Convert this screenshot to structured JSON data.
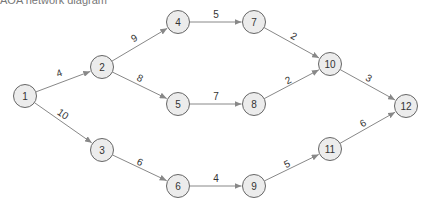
{
  "caption": "AOA network diagram",
  "colors": {
    "node_fill": "#ececec",
    "node_stroke": "#666666",
    "edge": "#888888",
    "text": "#333333"
  },
  "nodes": [
    {
      "id": "1",
      "x": 25,
      "y": 96
    },
    {
      "id": "2",
      "x": 102,
      "y": 67
    },
    {
      "id": "3",
      "x": 102,
      "y": 150
    },
    {
      "id": "4",
      "x": 178,
      "y": 22
    },
    {
      "id": "5",
      "x": 178,
      "y": 104
    },
    {
      "id": "6",
      "x": 178,
      "y": 186
    },
    {
      "id": "7",
      "x": 254,
      "y": 22
    },
    {
      "id": "8",
      "x": 254,
      "y": 104
    },
    {
      "id": "9",
      "x": 254,
      "y": 186
    },
    {
      "id": "10",
      "x": 330,
      "y": 64
    },
    {
      "id": "11",
      "x": 330,
      "y": 149
    },
    {
      "id": "12",
      "x": 406,
      "y": 106
    }
  ],
  "edges": [
    {
      "from": "1",
      "to": "2",
      "weight": "4",
      "lx": 59,
      "ly": 73
    },
    {
      "from": "1",
      "to": "3",
      "weight": "10",
      "lx": 63,
      "ly": 114
    },
    {
      "from": "2",
      "to": "4",
      "weight": "9",
      "lx": 134,
      "ly": 38
    },
    {
      "from": "2",
      "to": "5",
      "weight": "8",
      "lx": 140,
      "ly": 78
    },
    {
      "from": "3",
      "to": "6",
      "weight": "6",
      "lx": 140,
      "ly": 162
    },
    {
      "from": "4",
      "to": "7",
      "weight": "5",
      "lx": 216,
      "ly": 14
    },
    {
      "from": "5",
      "to": "8",
      "weight": "7",
      "lx": 216,
      "ly": 96
    },
    {
      "from": "6",
      "to": "9",
      "weight": "4",
      "lx": 216,
      "ly": 178
    },
    {
      "from": "7",
      "to": "10",
      "weight": "2",
      "lx": 294,
      "ly": 36
    },
    {
      "from": "8",
      "to": "10",
      "weight": "2",
      "lx": 288,
      "ly": 80
    },
    {
      "from": "9",
      "to": "11",
      "weight": "5",
      "lx": 287,
      "ly": 164
    },
    {
      "from": "10",
      "to": "12",
      "weight": "3",
      "lx": 369,
      "ly": 78
    },
    {
      "from": "11",
      "to": "12",
      "weight": "6",
      "lx": 363,
      "ly": 123
    }
  ]
}
